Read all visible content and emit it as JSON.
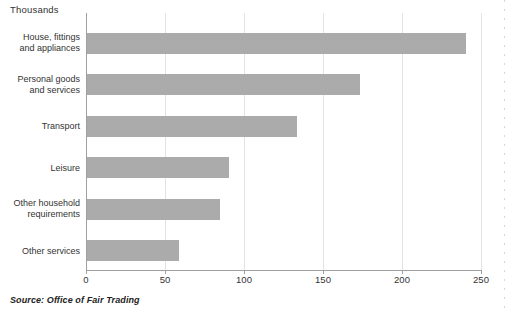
{
  "header": {
    "units_label": "Thousands"
  },
  "footer": {
    "source": "Source: Office of Fair Trading"
  },
  "colors": {
    "bar": "#ababab",
    "axis": "#a0a0a0",
    "gridline": "#e3e3e3",
    "text": "#333333"
  },
  "chart_data": {
    "type": "bar",
    "orientation": "horizontal",
    "title": "Thousands",
    "categories": [
      "House, fittings\nand appliances",
      "Personal goods\nand services",
      "Transport",
      "Leisure",
      "Other household\nrequirements",
      "Other services"
    ],
    "values": [
      240,
      173,
      133,
      90,
      84,
      58
    ],
    "xlabel": "",
    "ylabel": "",
    "xlim": [
      0,
      250
    ],
    "xticks": [
      0,
      50,
      100,
      150,
      200,
      250
    ],
    "grid": true,
    "legend": "none",
    "source": "Source: Office of Fair Trading"
  }
}
